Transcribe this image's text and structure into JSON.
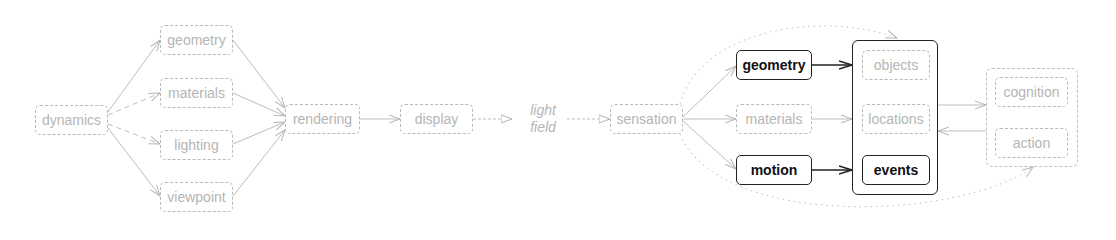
{
  "diagram": {
    "left_pipeline": {
      "source": "dynamics",
      "factors": [
        "geometry",
        "materials",
        "lighting",
        "viewpoint"
      ],
      "rendering": "rendering",
      "display": "display"
    },
    "light_field": {
      "line1": "light",
      "line2": "field"
    },
    "right_pipeline": {
      "sensation": "sensation",
      "features": [
        {
          "label": "geometry",
          "highlighted": true
        },
        {
          "label": "materials",
          "highlighted": false
        },
        {
          "label": "motion",
          "highlighted": true
        }
      ],
      "representations": [
        {
          "label": "objects",
          "highlighted": false
        },
        {
          "label": "locations",
          "highlighted": false
        },
        {
          "label": "events",
          "highlighted": true
        }
      ],
      "higher": [
        "cognition",
        "action"
      ]
    },
    "colors": {
      "faded": "#b5b5b5",
      "highlight": "#222222",
      "background": "#ffffff"
    }
  }
}
